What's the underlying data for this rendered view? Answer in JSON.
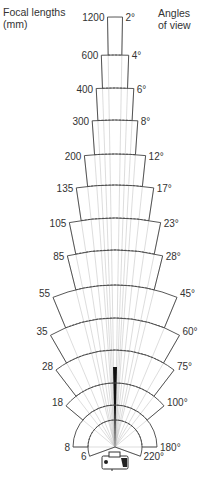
{
  "header": {
    "left_title_line1": "Focal lengths",
    "left_title_line2": "(mm)",
    "right_title_line1": "Angles",
    "right_title_line2": "of view"
  },
  "diagram": {
    "apex": [
      115,
      447
    ],
    "line_color": "#444444",
    "guide_color": "#aaaaaa",
    "bands": [
      {
        "focal": "1200",
        "angle": "2°",
        "deg": 2,
        "r": 430
      },
      {
        "focal": "600",
        "angle": "4°",
        "deg": 4,
        "r": 392
      },
      {
        "focal": "400",
        "angle": "6°",
        "deg": 6,
        "r": 359
      },
      {
        "focal": "300",
        "angle": "8°",
        "deg": 8,
        "r": 327
      },
      {
        "focal": "200",
        "angle": "12°",
        "deg": 12,
        "r": 293
      },
      {
        "focal": "135",
        "angle": "17°",
        "deg": 17,
        "r": 262
      },
      {
        "focal": "105",
        "angle": "23°",
        "deg": 23,
        "r": 229
      },
      {
        "focal": "85",
        "angle": "28°",
        "deg": 28,
        "r": 197
      },
      {
        "focal": "55",
        "angle": "45°",
        "deg": 45,
        "r": 162
      },
      {
        "focal": "35",
        "angle": "60°",
        "deg": 60,
        "r": 129
      },
      {
        "focal": "28",
        "angle": "75°",
        "deg": 75,
        "r": 97
      },
      {
        "focal": "18",
        "angle": "100°",
        "deg": 100,
        "r": 64
      },
      {
        "focal": "8",
        "angle": "180°",
        "deg": 180,
        "r": 42
      },
      {
        "focal": "6",
        "angle": "220°",
        "deg": 220,
        "r": 27
      }
    ],
    "camera_icon": "camera-icon"
  }
}
